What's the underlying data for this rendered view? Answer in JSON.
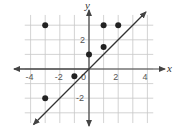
{
  "chart_data": {
    "type": "scatter",
    "title": "",
    "xlabel": "x",
    "ylabel": "y",
    "xlim": [
      -4.5,
      4.5
    ],
    "ylim": [
      -4,
      4
    ],
    "grid": true,
    "x_ticks": [
      "-4",
      "-2",
      "0",
      "2",
      "4"
    ],
    "y_ticks": [
      "2",
      "-2"
    ],
    "series": [
      {
        "name": "points",
        "type": "scatter",
        "points": [
          {
            "x": -3,
            "y": 3
          },
          {
            "x": 1,
            "y": 3
          },
          {
            "x": 2,
            "y": 3
          },
          {
            "x": 0,
            "y": 1
          },
          {
            "x": 1,
            "y": 1.5
          },
          {
            "x": -1,
            "y": -0.5
          },
          {
            "x": -3,
            "y": -2
          }
        ]
      },
      {
        "name": "line y = x",
        "type": "line",
        "equation": "y = x",
        "arrows": "both"
      }
    ],
    "colors": {
      "grid": "#c8c8c8",
      "axis": "#444444",
      "points": "#222222",
      "line": "#333333"
    }
  }
}
